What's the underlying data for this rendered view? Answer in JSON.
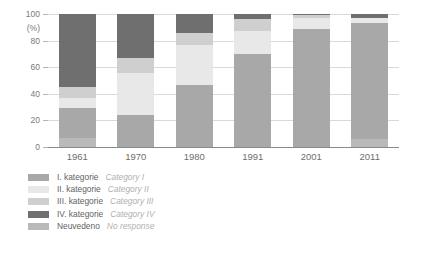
{
  "chart_data": {
    "type": "bar",
    "subtype": "stacked-100-percent",
    "title": "",
    "subtitle": "",
    "xlabel": "",
    "ylabel": "(%)",
    "ylim": [
      0,
      100
    ],
    "yticks": [
      0,
      20,
      40,
      60,
      80,
      100
    ],
    "grid": true,
    "legend_position": "bottom-left",
    "categories": [
      "1961",
      "1970",
      "1980",
      "1991",
      "2001",
      "2011"
    ],
    "series": [
      {
        "name": "I. kategorie",
        "name_en": "Category I",
        "color": "#a8a8a8",
        "pattern": "solid",
        "values": [
          22,
          24,
          47,
          70,
          89,
          87
        ]
      },
      {
        "name": "II. kategorie",
        "name_en": "Category II",
        "color": "#e8e8e8",
        "pattern": "solid",
        "values": [
          8,
          32,
          30,
          17,
          8,
          4
        ]
      },
      {
        "name": "III. kategorie",
        "name_en": "Category III",
        "color": "#cfcfcf",
        "pattern": "striped",
        "values": [
          8,
          11,
          9,
          9,
          2,
          0
        ]
      },
      {
        "name": "IV. kategorie",
        "name_en": "Category IV",
        "color": "#6f6f6f",
        "pattern": "striped",
        "values": [
          55,
          33,
          14,
          4,
          1,
          3
        ]
      },
      {
        "name": "Neuvedeno",
        "name_en": "No response",
        "color": "#b9b9b9",
        "pattern": "striped",
        "values": [
          7,
          0,
          0,
          0,
          0,
          6
        ]
      }
    ],
    "stack_order_bottom_to_top": [
      "Neuvedeno",
      "I. kategorie",
      "II. kategorie",
      "III. kategorie",
      "IV. kategorie"
    ]
  },
  "axis": {
    "y_unit_label": "(%)",
    "y_tick_labels": [
      "100",
      "80",
      "60",
      "40",
      "20",
      "0"
    ],
    "x_tick_labels": [
      "1961",
      "1970",
      "1980",
      "1991",
      "2001",
      "2011"
    ]
  },
  "legend": {
    "items": [
      {
        "label_cs": "I. kategorie",
        "label_en": "Category I",
        "color": "#a8a8a8",
        "pattern": "solid"
      },
      {
        "label_cs": "II. kategorie",
        "label_en": "Category II",
        "color": "#e8e8e8",
        "pattern": "solid"
      },
      {
        "label_cs": "III. kategorie",
        "label_en": "Category III",
        "color": "#cfcfcf",
        "pattern": "striped"
      },
      {
        "label_cs": "IV. kategorie",
        "label_en": "Category IV",
        "color": "#6f6f6f",
        "pattern": "striped"
      },
      {
        "label_cs": "Neuvedeno",
        "label_en": "No response",
        "color": "#b9b9b9",
        "pattern": "striped"
      }
    ]
  },
  "theme": {
    "background": "#ffffff",
    "gridline_color": "#d9d9d9",
    "axis_color": "#8a8a8a",
    "text_color": "#6e6e6e",
    "muted_text_color": "#b0b0b0"
  }
}
